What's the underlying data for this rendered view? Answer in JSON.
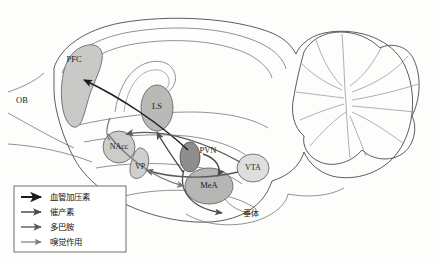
{
  "figure": {
    "background_color": "#fdfdfc",
    "brain_fill": "#e6e6e4",
    "outline_color": "#4a4a4a"
  },
  "regions": [
    {
      "id": "OB",
      "label": "OB",
      "x": 22,
      "y": 101,
      "fill": "none",
      "note": "olfactory bulb label, outside brain body"
    },
    {
      "id": "PFC",
      "label": "PFC",
      "x": 74,
      "y": 60,
      "fill": "#c9c9c7"
    },
    {
      "id": "LS",
      "label": "LS",
      "x": 157,
      "y": 107,
      "fill": "#b9b9b7"
    },
    {
      "id": "NAcc",
      "label": "NAcc",
      "x": 119,
      "y": 147,
      "fill": "#cccccb"
    },
    {
      "id": "VP",
      "label": "VP",
      "x": 140,
      "y": 167,
      "fill": "#cfcfcd"
    },
    {
      "id": "PVN",
      "label": "PVN",
      "x": 206,
      "y": 151,
      "fill": "#8e8e8c"
    },
    {
      "id": "MeA",
      "label": "MeA",
      "x": 209,
      "y": 185,
      "fill": "#b6b6b4"
    },
    {
      "id": "VTA",
      "label": "VTA",
      "x": 253,
      "y": 168,
      "fill": "#dedede"
    }
  ],
  "annotations": [
    {
      "id": "pituitary",
      "label": "垂体",
      "x": 250,
      "y": 213
    }
  ],
  "legend": {
    "box": {
      "x": 14,
      "y": 186,
      "width": 112,
      "height": 66
    },
    "items": [
      {
        "label": "血管加压素",
        "color": "#1c1c1c",
        "width": 2.0,
        "name": "vasopressin"
      },
      {
        "label": "催产素",
        "color": "#4d4d4d",
        "width": 1.5,
        "name": "oxytocin"
      },
      {
        "label": "多巴胺",
        "color": "#5a5a5a",
        "width": 1.4,
        "name": "dopamine"
      },
      {
        "label": "嗅觉作用",
        "color": "#7c7c7c",
        "width": 1.2,
        "name": "olfactory-action"
      }
    ]
  },
  "pathways": [
    {
      "from": "PVN",
      "to": "PFC",
      "transmitter": "血管加压素"
    },
    {
      "from": "PVN",
      "to": "LS",
      "transmitter": "催产素"
    },
    {
      "from": "PVN",
      "to": "MeA",
      "transmitter": "催产素"
    },
    {
      "from": "PVN",
      "to": "垂体",
      "transmitter": "催产素"
    },
    {
      "from": "VTA",
      "to": "NAcc",
      "transmitter": "多巴胺"
    },
    {
      "from": "VTA",
      "to": "VP",
      "transmitter": "多巴胺"
    },
    {
      "from": "OB",
      "to": "MeA",
      "transmitter": "嗅觉作用"
    }
  ]
}
